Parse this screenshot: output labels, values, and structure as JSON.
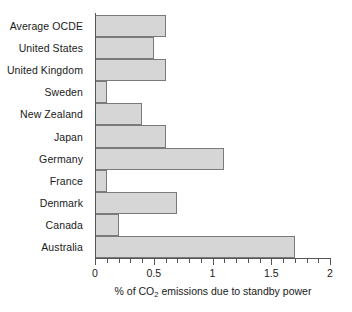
{
  "chart_data": {
    "type": "bar",
    "orientation": "horizontal",
    "title": "",
    "subtitle": "",
    "xlabel": "% of CO2 emissions due to standby power",
    "xlabel_parts": {
      "before": "% of CO",
      "subscript": "2",
      "after": " emissions due to standby power"
    },
    "ylabel": "",
    "xlim": [
      0,
      2
    ],
    "x_major_ticks": [
      0,
      0.5,
      1,
      1.5,
      2
    ],
    "x_major_tick_labels": [
      "0",
      "0.5",
      "1",
      "1.5",
      "2"
    ],
    "x_minor_tick_interval": 0.1,
    "grid": false,
    "legend": "none",
    "bar_fill_color": "#d6d6d6",
    "bar_edge_color": "#7a7a7a",
    "axis_color": "#555555",
    "categories": [
      "Average OCDE",
      "United States",
      "United Kingdom",
      "Sweden",
      "New Zealand",
      "Japan",
      "Germany",
      "France",
      "Denmark",
      "Canada",
      "Australia"
    ],
    "values": [
      0.6,
      0.5,
      0.6,
      0.1,
      0.4,
      0.6,
      1.1,
      0.1,
      0.7,
      0.2,
      1.7
    ]
  }
}
